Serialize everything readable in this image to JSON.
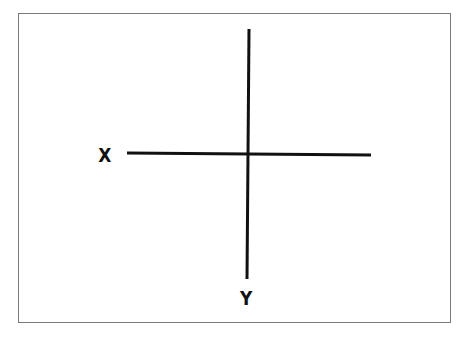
{
  "diagram": {
    "type": "coordinate-axes",
    "labels": {
      "x_axis": "X",
      "y_axis": "Y"
    },
    "colors": {
      "line": "#111111",
      "border": "#7a7a7a",
      "background": "#ffffff"
    }
  }
}
